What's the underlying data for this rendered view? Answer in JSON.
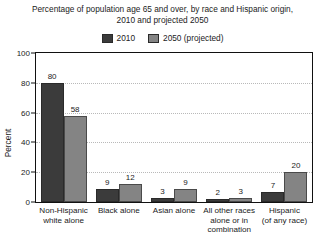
{
  "chart_data": {
    "type": "bar",
    "title": "Percentage of population age 65 and over, by race and Hispanic origin, 2010 and projected 2050",
    "title_lines": [
      "Percentage of population age 65 and over, by race and Hispanic origin,",
      "2010 and projected 2050"
    ],
    "xlabel": "",
    "ylabel": "Percent",
    "ylim": [
      0,
      100
    ],
    "yticks": [
      0,
      20,
      40,
      60,
      80,
      100
    ],
    "grid": "horizontal-dotted",
    "legend_position": "top-center",
    "categories": [
      "Non-Hispanic white alone",
      "Black alone",
      "Asian alone",
      "All other races alone or in combination",
      "Hispanic (of any race)"
    ],
    "category_lines": [
      [
        "Non-Hispanic",
        "white alone"
      ],
      [
        "Black alone"
      ],
      [
        "Asian alone"
      ],
      [
        "All other races",
        "alone or in",
        "combination"
      ],
      [
        "Hispanic",
        "(of any race)"
      ]
    ],
    "series": [
      {
        "name": "2010",
        "color": "#3b3b3b",
        "values": [
          80,
          9,
          3,
          2,
          7
        ]
      },
      {
        "name": "2050 (projected)",
        "color": "#848484",
        "values": [
          58,
          12,
          9,
          3,
          20
        ]
      }
    ]
  },
  "legend": {
    "items": [
      {
        "label": "2010",
        "swatch": "legend-swatch-2010"
      },
      {
        "label": "2050 (projected)",
        "swatch": "legend-swatch-2050"
      }
    ]
  },
  "axis": {
    "y_title": "Percent",
    "y_ticks": [
      "100",
      "80",
      "60",
      "40",
      "20",
      "0"
    ]
  }
}
